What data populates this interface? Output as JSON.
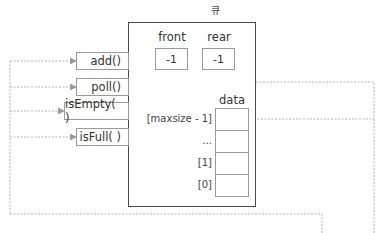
{
  "diagram": {
    "title": "큐",
    "methods": [
      {
        "label": "add()"
      },
      {
        "label": "poll()"
      },
      {
        "label": "isEmpty( )"
      },
      {
        "label": "isFull( )"
      }
    ],
    "fields": [
      {
        "label": "front",
        "value": "-1"
      },
      {
        "label": "rear",
        "value": "-1"
      }
    ],
    "array": {
      "label": "data",
      "indices": [
        "[maxsize - 1]",
        "...",
        "[1]",
        "[0]"
      ]
    },
    "colors": {
      "box_border": "#4a4a4a",
      "cell_border": "#9a9a9a",
      "dashed_line": "#b0b0b0",
      "arrow": "#9a9a9a"
    }
  }
}
